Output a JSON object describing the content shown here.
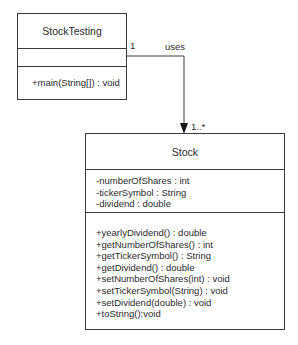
{
  "diagram": {
    "type": "UML class diagram",
    "classes": [
      {
        "name": "StockTesting",
        "attributes": [],
        "methods": [
          "+main(String[]) : void"
        ]
      },
      {
        "name": "Stock",
        "attributes": [
          "-numberOfShares : int",
          "-tickerSymbol : String",
          "-dividend : double"
        ],
        "methods": [
          "+yearlyDividend() : double",
          "+getNumberOfShares() : int",
          "+getTickerSymbol() : String",
          "+getDividend() : double",
          "+setNumberOfShares(int) : void",
          "+setTickerSymbol(String) : void",
          "+setDividend(double) : void",
          "+toString():void"
        ]
      }
    ],
    "association": {
      "from": "StockTesting",
      "to": "Stock",
      "label": "uses",
      "source_multiplicity": "1",
      "target_multiplicity": "1..*"
    }
  }
}
